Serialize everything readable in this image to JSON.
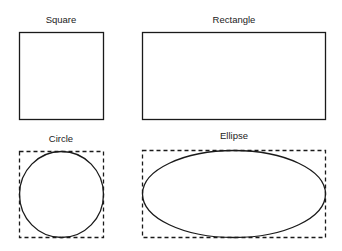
{
  "shapes": {
    "square": {
      "label": "Square"
    },
    "rectangle": {
      "label": "Rectangle"
    },
    "circle": {
      "label": "Circle"
    },
    "ellipse": {
      "label": "Ellipse"
    }
  },
  "colors": {
    "stroke": "#1a1a1a",
    "background": "#ffffff"
  }
}
